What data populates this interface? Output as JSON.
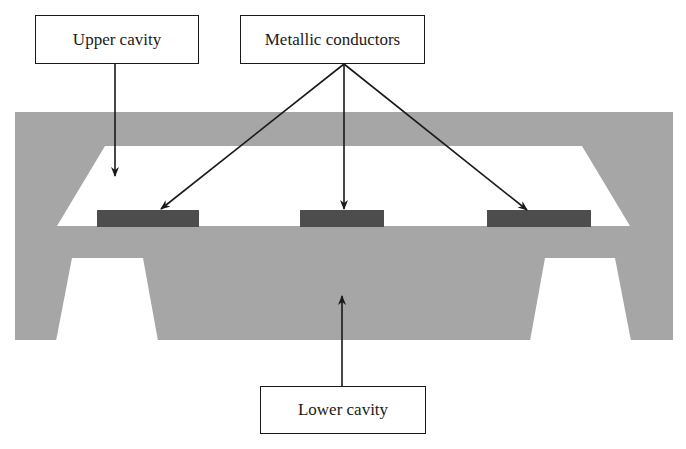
{
  "labels": {
    "upper_cavity": "Upper cavity",
    "metallic_conductors": "Metallic conductors",
    "lower_cavity": "Lower cavity"
  },
  "colors": {
    "substrate": "#a6a6a6",
    "conductor": "#4d4d4d",
    "cavity": "#ffffff",
    "line": "#1a1a1a"
  },
  "structure": {
    "substrate": {
      "x": 15,
      "y": 112,
      "width": 658,
      "height": 228
    },
    "upper_cavity": {
      "points": [
        [
          105,
          146
        ],
        [
          582,
          146
        ],
        [
          630,
          226
        ],
        [
          57,
          226
        ]
      ]
    },
    "lower_cavity_left": {
      "points": [
        [
          72,
          258
        ],
        [
          143,
          258
        ],
        [
          158,
          341
        ],
        [
          56,
          341
        ]
      ]
    },
    "lower_cavity_right": {
      "points": [
        [
          545,
          258
        ],
        [
          615,
          258
        ],
        [
          631,
          341
        ],
        [
          530,
          341
        ]
      ]
    },
    "conductors": [
      {
        "x": 97,
        "y": 210,
        "width": 102,
        "height": 17
      },
      {
        "x": 300,
        "y": 210,
        "width": 84,
        "height": 17
      },
      {
        "x": 487,
        "y": 210,
        "width": 104,
        "height": 17
      }
    ]
  },
  "arrows": [
    {
      "from": [
        115,
        63
      ],
      "to": [
        115,
        176
      ],
      "label": "upper_cavity"
    },
    {
      "from": [
        344,
        64
      ],
      "to": [
        161,
        209
      ],
      "label": "metallic_conductors"
    },
    {
      "from": [
        344,
        64
      ],
      "to": [
        344,
        209
      ],
      "label": "metallic_conductors"
    },
    {
      "from": [
        344,
        64
      ],
      "to": [
        527,
        210
      ],
      "label": "metallic_conductors"
    },
    {
      "from": [
        342,
        386
      ],
      "to": [
        342,
        296
      ],
      "label": "lower_cavity"
    }
  ]
}
